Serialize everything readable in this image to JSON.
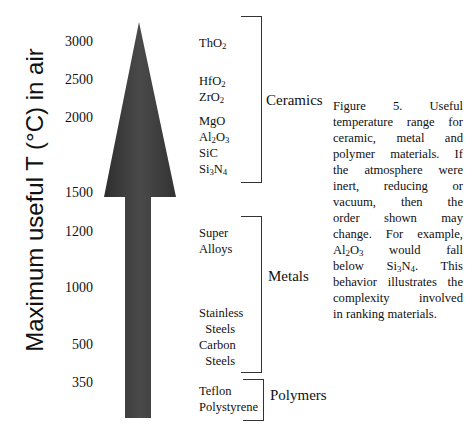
{
  "axis": {
    "label": "Maximum useful T (°C) in air",
    "ticks": [
      {
        "value": "3000",
        "y": 35
      },
      {
        "value": "2500",
        "y": 73
      },
      {
        "value": "2000",
        "y": 111
      },
      {
        "value": "1500",
        "y": 186
      },
      {
        "value": "1200",
        "y": 225
      },
      {
        "value": "1000",
        "y": 281
      },
      {
        "value": "500",
        "y": 338
      },
      {
        "value": "350",
        "y": 376
      }
    ]
  },
  "arrow": {
    "color": "#3a3a3a",
    "direction": "up"
  },
  "groups": [
    {
      "label": "Ceramics",
      "materials": [
        {
          "html": "ThO<sub>2</sub>",
          "y": 35
        },
        {
          "html": "HfO<sub>2</sub>",
          "y": 73
        },
        {
          "html": "ZrO<sub>2</sub>",
          "y": 89
        },
        {
          "html": "MgO",
          "y": 113
        },
        {
          "html": "Al<sub>2</sub>O<sub>3</sub>",
          "y": 129
        },
        {
          "html": "SiC",
          "y": 145
        },
        {
          "html": "Si<sub>3</sub>N<sub>4</sub>",
          "y": 161
        }
      ]
    },
    {
      "label": "Metals",
      "materials": [
        {
          "html": "Super",
          "y": 225
        },
        {
          "html": "Alloys",
          "y": 241
        },
        {
          "html": "Stainless",
          "y": 305
        },
        {
          "html": "&nbsp;&nbsp;Steels",
          "y": 321
        },
        {
          "html": "Carbon",
          "y": 337
        },
        {
          "html": "&nbsp;&nbsp;Steels",
          "y": 353
        }
      ]
    },
    {
      "label": "Polymers",
      "materials": [
        {
          "html": "Teflon",
          "y": 383
        },
        {
          "html": "Polystyrene",
          "y": 399
        }
      ]
    }
  ],
  "caption": {
    "lines": [
      "Figure 5. Useful",
      "temperature range for",
      "ceramic, metal and",
      "polymer materials. If",
      "the atmosphere were",
      "inert, reducing or",
      "vacuum, then the",
      "order shown may",
      "change. For example,",
      "Al<sub>2</sub>O<sub>3</sub> would fall",
      "below Si<sub>3</sub>N<sub>4</sub>. This",
      "behavior illustrates the",
      "complexity involved",
      "in ranking materials."
    ]
  },
  "chart_data": {
    "type": "table",
    "ylabel": "Maximum useful T (°C) in air",
    "yticks": [
      3000,
      2500,
      2000,
      1500,
      1200,
      1000,
      500,
      350
    ],
    "groups": [
      {
        "name": "Ceramics",
        "members": [
          "ThO2",
          "HfO2",
          "ZrO2",
          "MgO",
          "Al2O3",
          "SiC",
          "Si3N4"
        ],
        "range_C": [
          1500,
          3000
        ]
      },
      {
        "name": "Metals",
        "members": [
          "Super Alloys",
          "Stainless Steels",
          "Carbon Steels"
        ],
        "range_C": [
          500,
          1200
        ]
      },
      {
        "name": "Polymers",
        "members": [
          "Teflon",
          "Polystyrene"
        ],
        "range_C": [
          0,
          350
        ]
      }
    ],
    "approx_material_temps_C": {
      "ThO2": 3000,
      "HfO2": 2500,
      "ZrO2": 2400,
      "MgO": 2000,
      "Al2O3": 1900,
      "SiC": 1800,
      "Si3N4": 1700,
      "Super Alloys": 1200,
      "Stainless Steels": 800,
      "Carbon Steels": 500,
      "Teflon": 350,
      "Polystyrene": 250
    }
  }
}
